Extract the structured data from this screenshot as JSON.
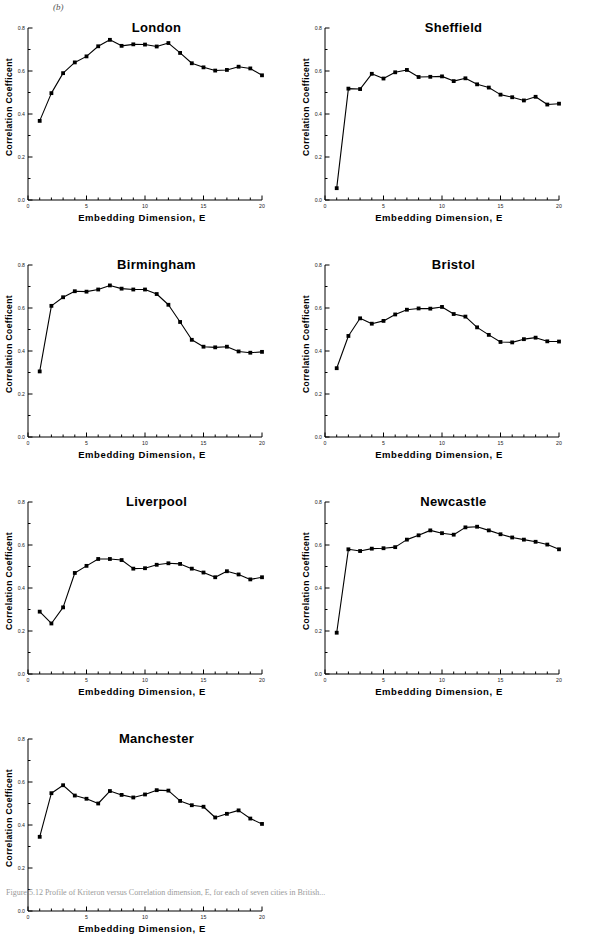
{
  "figure": {
    "panel_label": "(b)",
    "caption": "Figure 5.12  Profile of Kriteron versus Correlation dimension, E, for each of seven cities in British...",
    "axis": {
      "xlabel": "Embedding  Dimension,  E",
      "ylabel": "Correlation   Coefficent",
      "xticks": [
        "0",
        "5",
        "10",
        "15",
        "20"
      ],
      "yticks": [
        "0.0",
        "0.2",
        "0.4",
        "0.6",
        "0.8"
      ],
      "xlim": [
        0,
        20
      ],
      "ylim": [
        0.0,
        0.8
      ]
    },
    "marker_color": "#000000",
    "line_color": "#000000"
  },
  "chart_data": [
    {
      "type": "line",
      "title": "London",
      "xlabel": "Embedding  Dimension,  E",
      "ylabel": "Correlation   Coefficent",
      "xlim": [
        0,
        20
      ],
      "ylim": [
        0.0,
        0.8
      ],
      "grid": false,
      "legend": "none",
      "x": [
        1,
        2,
        3,
        4,
        5,
        6,
        7,
        8,
        9,
        10,
        11,
        12,
        13,
        14,
        15,
        16,
        17,
        18,
        19,
        20
      ],
      "values": [
        0.368,
        0.497,
        0.59,
        0.64,
        0.668,
        0.715,
        0.745,
        0.717,
        0.724,
        0.723,
        0.714,
        0.73,
        0.684,
        0.636,
        0.617,
        0.602,
        0.605,
        0.62,
        0.612,
        0.58
      ]
    },
    {
      "type": "line",
      "title": "Sheffield",
      "xlabel": "Embedding  Dimension,  E",
      "ylabel": "Correlation   Coefficent",
      "xlim": [
        0,
        20
      ],
      "ylim": [
        0.0,
        0.8
      ],
      "grid": false,
      "legend": "none",
      "x": [
        1,
        2,
        3,
        4,
        5,
        6,
        7,
        8,
        9,
        10,
        11,
        12,
        13,
        14,
        15,
        16,
        17,
        18,
        19,
        20
      ],
      "values": [
        0.055,
        0.518,
        0.516,
        0.587,
        0.565,
        0.594,
        0.605,
        0.572,
        0.573,
        0.575,
        0.553,
        0.566,
        0.538,
        0.523,
        0.49,
        0.478,
        0.463,
        0.48,
        0.444,
        0.448
      ]
    },
    {
      "type": "line",
      "title": "Birmingham",
      "xlabel": "Embedding  Dimension,  E",
      "ylabel": "Correlation   Coefficent",
      "xlim": [
        0,
        20
      ],
      "ylim": [
        0.0,
        0.8
      ],
      "grid": false,
      "legend": "none",
      "x": [
        1,
        2,
        3,
        4,
        5,
        6,
        7,
        8,
        9,
        10,
        11,
        12,
        13,
        14,
        15,
        16,
        17,
        18,
        19,
        20
      ],
      "values": [
        0.305,
        0.61,
        0.65,
        0.678,
        0.676,
        0.686,
        0.705,
        0.69,
        0.686,
        0.686,
        0.665,
        0.615,
        0.535,
        0.452,
        0.42,
        0.417,
        0.42,
        0.398,
        0.392,
        0.396
      ]
    },
    {
      "type": "line",
      "title": "Bristol",
      "xlabel": "Embedding  Dimension,  E",
      "ylabel": "Correlation   Coefficent",
      "xlim": [
        0,
        20
      ],
      "ylim": [
        0.0,
        0.8
      ],
      "grid": false,
      "legend": "none",
      "x": [
        1,
        2,
        3,
        4,
        5,
        6,
        7,
        8,
        9,
        10,
        11,
        12,
        13,
        14,
        15,
        16,
        17,
        18,
        19,
        20
      ],
      "values": [
        0.32,
        0.47,
        0.552,
        0.527,
        0.54,
        0.57,
        0.592,
        0.598,
        0.597,
        0.605,
        0.572,
        0.56,
        0.51,
        0.475,
        0.442,
        0.44,
        0.455,
        0.462,
        0.445,
        0.444
      ]
    },
    {
      "type": "line",
      "title": "Liverpool",
      "xlabel": "Embedding  Dimension,  E",
      "ylabel": "Correlation   Coefficent",
      "xlim": [
        0,
        20
      ],
      "ylim": [
        0.0,
        0.8
      ],
      "grid": false,
      "legend": "none",
      "x": [
        1,
        2,
        3,
        4,
        5,
        6,
        7,
        8,
        9,
        10,
        11,
        12,
        13,
        14,
        15,
        16,
        17,
        18,
        19,
        20
      ],
      "values": [
        0.29,
        0.235,
        0.31,
        0.47,
        0.503,
        0.535,
        0.535,
        0.53,
        0.49,
        0.492,
        0.508,
        0.515,
        0.512,
        0.49,
        0.472,
        0.45,
        0.478,
        0.463,
        0.44,
        0.45
      ]
    },
    {
      "type": "line",
      "title": "Newcastle",
      "xlabel": "Embedding  Dimension,  E",
      "ylabel": "Correlation   Coefficent",
      "xlim": [
        0,
        20
      ],
      "ylim": [
        0.0,
        0.8
      ],
      "grid": false,
      "legend": "none",
      "x": [
        1,
        2,
        3,
        4,
        5,
        6,
        7,
        8,
        9,
        10,
        11,
        12,
        13,
        14,
        15,
        16,
        17,
        18,
        19,
        20
      ],
      "values": [
        0.192,
        0.58,
        0.572,
        0.583,
        0.585,
        0.59,
        0.625,
        0.645,
        0.668,
        0.655,
        0.648,
        0.682,
        0.685,
        0.668,
        0.65,
        0.635,
        0.625,
        0.615,
        0.602,
        0.58
      ]
    },
    {
      "type": "line",
      "title": "Manchester",
      "xlabel": "Embedding  Dimension,  E",
      "ylabel": "Correlation   Coefficent",
      "xlim": [
        0,
        20
      ],
      "ylim": [
        0.0,
        0.8
      ],
      "grid": false,
      "legend": "none",
      "x": [
        1,
        2,
        3,
        4,
        5,
        6,
        7,
        8,
        9,
        10,
        11,
        12,
        13,
        14,
        15,
        16,
        17,
        18,
        19,
        20
      ],
      "values": [
        0.345,
        0.548,
        0.585,
        0.537,
        0.522,
        0.5,
        0.558,
        0.54,
        0.528,
        0.542,
        0.562,
        0.56,
        0.512,
        0.492,
        0.485,
        0.435,
        0.452,
        0.468,
        0.43,
        0.405
      ]
    }
  ]
}
